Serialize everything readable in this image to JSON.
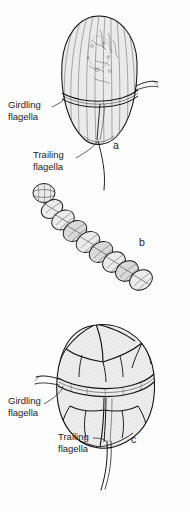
{
  "figure": {
    "background_color": "#fdfdfd",
    "ink_color": "#141414",
    "panels": [
      {
        "letter": "a",
        "name": "unarmored-dinoflagellate",
        "description": "Unarmored (naked) dinoflagellate cell with longitudinal striations, transverse cingulum and two flagella",
        "labels": [
          {
            "id": "girdling-flagella",
            "line1": "Girdling",
            "line2": "flagella"
          },
          {
            "id": "trailing-flagella",
            "line1": "Trailing",
            "line2": "flagella"
          }
        ]
      },
      {
        "letter": "b",
        "name": "chain-forming-colony",
        "description": "Chain-forming colonial dinoflagellate composed of stacked disc-shaped cells",
        "labels": []
      },
      {
        "letter": "c",
        "name": "armored-dinoflagellate",
        "description": "Armored (thecate) dinoflagellate showing polygonal cellulose thecal plates, cingulum and two flagella",
        "labels": [
          {
            "id": "girdling-flagella",
            "line1": "Girdling",
            "line2": "flagella"
          },
          {
            "id": "trailing-flagella",
            "line1": "Trailing",
            "line2": "flagella"
          }
        ]
      }
    ]
  },
  "labels": {
    "girdling_line1": "Girdling",
    "girdling_line2": "flagella",
    "trailing_line1": "Trailing",
    "trailing_line2": "flagella",
    "letter_a": "a",
    "letter_b": "b",
    "letter_c": "c"
  }
}
